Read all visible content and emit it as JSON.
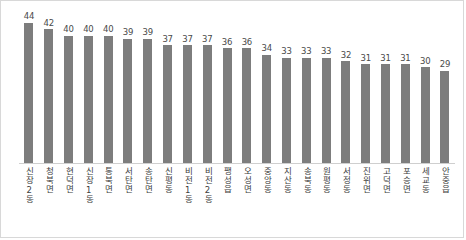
{
  "chart_data": {
    "type": "bar",
    "title": "",
    "subtitle": "",
    "xlabel": "",
    "ylabel": "",
    "ylim": [
      0,
      46
    ],
    "grid": false,
    "legend": "none",
    "bar_color": "#7d7d7d",
    "value_label_color": "#4a4a4a",
    "axis_color": "#cfcfcf",
    "frame_color": "#d8d8d8",
    "categories": [
      "신장2동",
      "청북면",
      "현덕면",
      "신장1동",
      "통북면",
      "서탄면",
      "송탄면",
      "신평동",
      "비전1동",
      "비전2동",
      "팽성읍",
      "오성면",
      "중앙동",
      "지산동",
      "송북동",
      "원평동",
      "서정동",
      "진위면",
      "고덕면",
      "포승면",
      "세교동",
      "안중읍"
    ],
    "values": [
      44,
      42,
      40,
      40,
      40,
      39,
      39,
      37,
      37,
      37,
      36,
      36,
      34,
      33,
      33,
      33,
      32,
      31,
      31,
      31,
      30,
      29
    ]
  }
}
